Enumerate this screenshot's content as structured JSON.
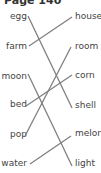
{
  "page": {
    "title": "Page 140"
  },
  "left_words": [
    {
      "label": "egg"
    },
    {
      "label": "farm"
    },
    {
      "label": "moon"
    },
    {
      "label": "bed"
    },
    {
      "label": "pop"
    },
    {
      "label": "water"
    }
  ],
  "right_words": [
    {
      "label": "house"
    },
    {
      "label": "room"
    },
    {
      "label": "corn"
    },
    {
      "label": "shell"
    },
    {
      "label": "melon"
    },
    {
      "label": "light"
    }
  ],
  "matches": [
    {
      "from": "egg",
      "to": "shell"
    },
    {
      "from": "farm",
      "to": "house"
    },
    {
      "from": "moon",
      "to": "light"
    },
    {
      "from": "bed",
      "to": "corn"
    },
    {
      "from": "pop",
      "to": "room"
    },
    {
      "from": "water",
      "to": "melon"
    }
  ],
  "colors": {
    "line": "#808080",
    "text": "#444444"
  }
}
